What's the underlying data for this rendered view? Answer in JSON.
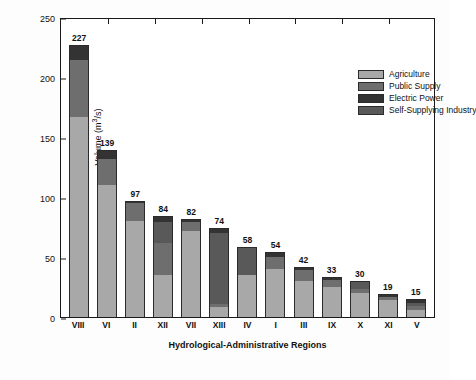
{
  "chart_data": {
    "type": "bar",
    "subtype": "stacked-bar",
    "title": "",
    "xlabel": "Hydrological-Administrative Regions",
    "ylabel": "Volume (m³/s)",
    "ylim": [
      0,
      250
    ],
    "yticks": [
      0,
      50,
      100,
      150,
      200,
      250
    ],
    "grid": false,
    "legend_position": "upper-right-inset",
    "categories": [
      "VIII",
      "VI",
      "II",
      "XII",
      "VII",
      "XIII",
      "IV",
      "I",
      "III",
      "IX",
      "X",
      "XI",
      "V"
    ],
    "totals": [
      227,
      139,
      97,
      84,
      82,
      74,
      58,
      54,
      42,
      33,
      30,
      19,
      15
    ],
    "series": [
      {
        "name": "Agriculture",
        "color": "#a8a8a8",
        "values": [
          167,
          110,
          80,
          35,
          72,
          8,
          35,
          40,
          30,
          25,
          20,
          14,
          6
        ]
      },
      {
        "name": "Public Supply",
        "color": "#6e6e6e",
        "values": [
          47,
          22,
          15,
          27,
          7,
          3,
          0,
          10,
          9,
          6,
          3,
          3,
          3
        ]
      },
      {
        "name": "Electric Power",
        "color": "#333333",
        "values": [
          13,
          7,
          2,
          5,
          3,
          4,
          0,
          4,
          3,
          2,
          1,
          2,
          3
        ]
      },
      {
        "name": "Self-Supplying Industry",
        "color": "#595959",
        "values": [
          0,
          0,
          0,
          17,
          0,
          59,
          23,
          0,
          0,
          0,
          6,
          0,
          3
        ]
      }
    ],
    "value_labels": [
      "227",
      "139",
      "97",
      "84",
      "82",
      "74",
      "58",
      "54",
      "42",
      "33",
      "30",
      "19",
      "15"
    ]
  },
  "legend": {
    "items": [
      {
        "label": "Agriculture",
        "color": "#a8a8a8"
      },
      {
        "label": "Public Supply",
        "color": "#6e6e6e"
      },
      {
        "label": "Electric Power",
        "color": "#333333"
      },
      {
        "label": "Self-Supplying Industry",
        "color": "#595959"
      }
    ]
  },
  "axis": {
    "y_title_main": "Volume (m",
    "y_title_sup": "3",
    "y_title_tail": "/s)",
    "x_title": "Hydrological-Administrative Regions",
    "ytick_labels": [
      "0",
      "50",
      "100",
      "150",
      "200",
      "250"
    ]
  },
  "colors": {
    "frame": "#1a1a1a",
    "background": "#ffffff",
    "text": "#111111"
  }
}
